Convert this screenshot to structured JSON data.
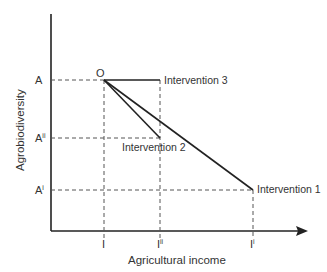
{
  "diagram": {
    "x_axis_label": "Agricultural income",
    "y_axis_label": "Agrobiodiversity",
    "origin_point_label": "O",
    "y_ticks": [
      {
        "label": "A",
        "sup": ""
      },
      {
        "label": "A",
        "sup": "ii"
      },
      {
        "label": "A",
        "sup": "i"
      }
    ],
    "x_ticks": [
      {
        "label": "I",
        "sup": ""
      },
      {
        "label": "I",
        "sup": "ii"
      },
      {
        "label": "I",
        "sup": "i"
      }
    ],
    "interventions": [
      {
        "label": "Intervention 1",
        "from": "O (I, A)",
        "to": "(I^i, A^i)"
      },
      {
        "label": "Intervention 2",
        "from": "O (I, A)",
        "to": "(I^ii, A^ii)"
      },
      {
        "label": "Intervention 3",
        "from": "O (I, A)",
        "to": "(I^ii, A)"
      }
    ],
    "colors": {
      "line": "#222222",
      "dash": "#555555",
      "text": "#333333"
    }
  }
}
